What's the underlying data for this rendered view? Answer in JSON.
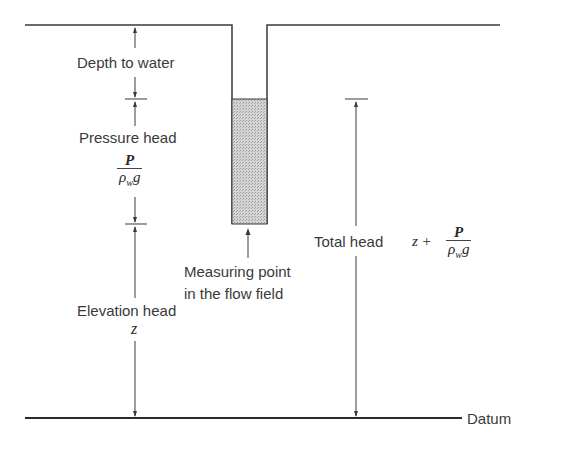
{
  "diagram": {
    "labels": {
      "depth_to_water": "Depth to water",
      "pressure_head": "Pressure head",
      "pressure_head_num": "P",
      "pressure_head_den_base": "ρ",
      "pressure_head_den_sub": "w",
      "pressure_head_den_tail": "g",
      "measuring_point_line1": "Measuring point",
      "measuring_point_line2": "in the flow field",
      "elevation_head": "Elevation head",
      "elevation_head_symbol": "z",
      "total_head": "Total head",
      "total_head_prefix": "z +",
      "total_head_num": "P",
      "total_head_den_base": "ρ",
      "total_head_den_sub": "w",
      "total_head_den_tail": "g",
      "datum": "Datum"
    },
    "colors": {
      "line": "#3a3a3a",
      "water_fill": "#c8c8c8",
      "text": "#3a3a3a"
    }
  }
}
